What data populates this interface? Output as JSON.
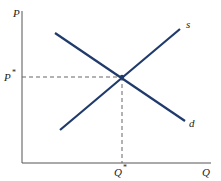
{
  "diagram": {
    "type": "supply-demand",
    "axes": {
      "y_label": "P",
      "x_label": "Q"
    },
    "curves": {
      "supply": {
        "label": "s",
        "color": "#1f3a6b"
      },
      "demand": {
        "label": "d",
        "color": "#1f3a6b"
      }
    },
    "equilibrium": {
      "price_label": "P",
      "price_star": "*",
      "quantity_label": "Q",
      "quantity_star": "*"
    },
    "colors": {
      "axis": "#555555",
      "curve": "#1f3a6b",
      "guide": "#666666"
    }
  }
}
